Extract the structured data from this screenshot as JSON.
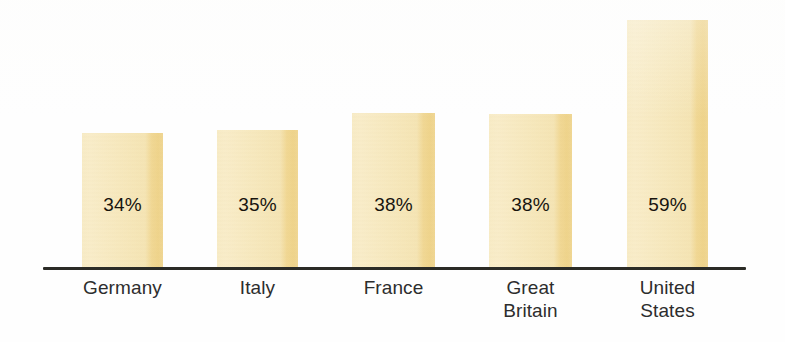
{
  "chart_data": {
    "type": "bar",
    "title": "",
    "subtitle": "",
    "xlabel": "",
    "ylabel": "",
    "categories": [
      "Germany",
      "Italy",
      "France",
      "Great\nBritain",
      "United\nStates"
    ],
    "values": [
      34,
      35,
      38,
      38,
      59
    ],
    "value_labels": [
      "34%",
      "35%",
      "38%",
      "38%",
      "59%"
    ],
    "ylim": [
      0,
      59
    ],
    "grid": false,
    "legend": null,
    "legend_position": "none",
    "annotations": [],
    "axis": {
      "baseline_visible": true,
      "y_axis_visible": false,
      "tick_labels": []
    },
    "colors": {
      "bar_fill_light": "#f8ecc7",
      "bar_fill_mid": "#f7e9bf",
      "bar_fill_shadow": "#efd48c",
      "axis_line": "#2b2b26",
      "value_text": "#17140f",
      "category_text": "#2d2d2d",
      "background": "#ffffff"
    }
  },
  "bars": [
    {
      "name": "germany",
      "label": "Germany",
      "value_label": "34%",
      "x": 82,
      "width": 81,
      "top": 133,
      "height": 136,
      "label_x": 56,
      "label_width": 133,
      "label_top": 276,
      "value_x": 82,
      "value_width": 81,
      "value_top": 194
    },
    {
      "name": "italy",
      "label": "Italy",
      "value_label": "35%",
      "x": 217,
      "width": 81,
      "top": 130,
      "height": 139,
      "label_x": 191,
      "label_width": 133,
      "label_top": 276,
      "value_x": 217,
      "value_width": 81,
      "value_top": 194
    },
    {
      "name": "france",
      "label": "France",
      "value_label": "38%",
      "x": 352,
      "width": 83,
      "top": 113,
      "height": 156,
      "label_x": 327,
      "label_width": 133,
      "label_top": 276,
      "value_x": 352,
      "value_width": 83,
      "value_top": 194
    },
    {
      "name": "great-britain",
      "label": "Great\nBritain",
      "value_label": "38%",
      "x": 489,
      "width": 83,
      "top": 114,
      "height": 155,
      "label_x": 464,
      "label_width": 133,
      "label_top": 276,
      "value_x": 489,
      "value_width": 83,
      "value_top": 194
    },
    {
      "name": "united-states",
      "label": "United\nStates",
      "value_label": "59%",
      "x": 627,
      "width": 81,
      "top": 20,
      "height": 249,
      "label_x": 601,
      "label_width": 133,
      "label_top": 276,
      "value_x": 627,
      "value_width": 81,
      "value_top": 194
    }
  ]
}
